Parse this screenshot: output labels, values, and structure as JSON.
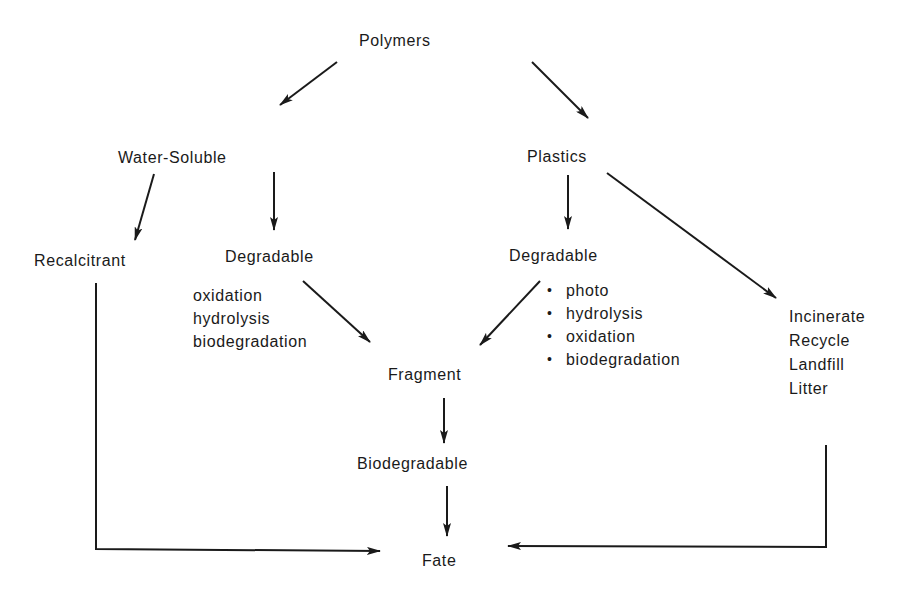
{
  "diagram": {
    "type": "flowchart",
    "nodes": {
      "polymers": "Polymers",
      "water_soluble": "Water-Soluble",
      "plastics": "Plastics",
      "recalcitrant": "Recalcitrant",
      "ws_degradable": "Degradable",
      "pl_degradable": "Degradable",
      "fragment": "Fragment",
      "biodegradable": "Biodegradable",
      "fate": "Fate"
    },
    "ws_degradation_modes": [
      "oxidation",
      "hydrolysis",
      "biodegradation"
    ],
    "pl_degradation_modes": [
      "photo",
      "hydrolysis",
      "oxidation",
      "biodegradation"
    ],
    "plastics_disposal": [
      "Incinerate",
      "Recycle",
      "Landfill",
      "Litter"
    ],
    "bullet_glyph": "•",
    "edges": [
      {
        "from": "Polymers",
        "to": "Water-Soluble"
      },
      {
        "from": "Polymers",
        "to": "Plastics"
      },
      {
        "from": "Water-Soluble",
        "to": "Recalcitrant"
      },
      {
        "from": "Water-Soluble",
        "to": "Degradable"
      },
      {
        "from": "Plastics",
        "to": "Degradable"
      },
      {
        "from": "Plastics",
        "to": "Incinerate/Recycle/Landfill/Litter"
      },
      {
        "from": "Degradable (water-soluble)",
        "to": "Fragment"
      },
      {
        "from": "Degradable (plastics)",
        "to": "Fragment"
      },
      {
        "from": "Fragment",
        "to": "Biodegradable"
      },
      {
        "from": "Biodegradable",
        "to": "Fate"
      },
      {
        "from": "Recalcitrant",
        "to": "Fate"
      },
      {
        "from": "Incinerate/Recycle/Landfill/Litter",
        "to": "Fate"
      }
    ],
    "colors": {
      "ink": "#1a1a1a",
      "background": "#ffffff"
    }
  }
}
